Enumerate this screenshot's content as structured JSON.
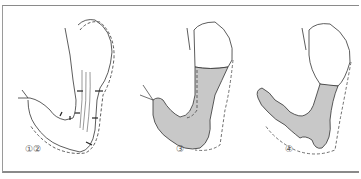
{
  "diagram": {
    "panels": [
      {
        "label": "①②",
        "description": "stomach and duodenum outline with contraction arrows"
      },
      {
        "label": "③",
        "description": "barium-filled stomach and duodenum"
      },
      {
        "label": "④",
        "description": "barium-filled stomach with peristaltic duodenum"
      }
    ],
    "colors": {
      "fill": "#c8c8c8",
      "stroke": "#333333",
      "frame": "#8a8a8a"
    }
  }
}
